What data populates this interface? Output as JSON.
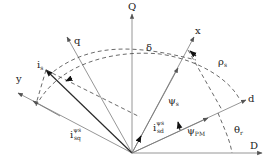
{
  "diagram": {
    "axes": {
      "D": "D",
      "Q": "Q",
      "d": "d",
      "q": "q",
      "x": "x",
      "y": "y"
    },
    "vectors": {
      "psi_s": {
        "base": "ψ",
        "sub": "s"
      },
      "psi_pm": {
        "base": "ψ",
        "sub": "PM"
      },
      "i_s": {
        "base": "i",
        "sub": "s"
      },
      "i_sd_psi": {
        "base": "i",
        "sub": "sd",
        "sup": "ψs"
      },
      "i_sq_psi": {
        "base": "i",
        "sub": "sq",
        "sup": "ψs"
      }
    },
    "angles": {
      "delta": "δ",
      "rho_s": {
        "base": "ρ",
        "sub": "s"
      },
      "theta_r": {
        "base": "θ",
        "sub": "r"
      }
    }
  }
}
